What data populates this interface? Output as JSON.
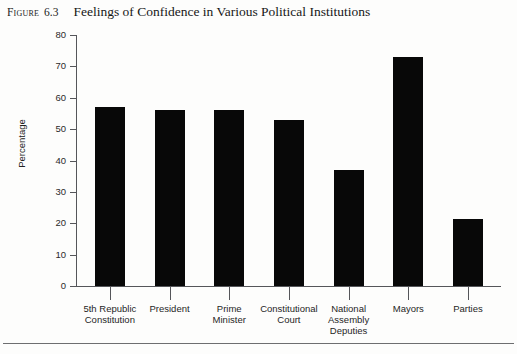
{
  "figure": {
    "label": "Figure",
    "number": "6.3",
    "title": "Feelings of Confidence in Various Political Institutions"
  },
  "chart_data": {
    "type": "bar",
    "title": "Feelings of Confidence in Various Political Institutions",
    "xlabel": "",
    "ylabel": "Percentage",
    "ylim": [
      0,
      80
    ],
    "yticks": [
      0,
      10,
      20,
      30,
      40,
      50,
      60,
      70,
      80
    ],
    "grid": false,
    "legend": false,
    "bar_color": "#080808",
    "axis_color": "#55565a",
    "categories": [
      "5th Republic Constitution",
      "President",
      "Prime Minister",
      "Constitutional Court",
      "National Assembly Deputies",
      "Mayors",
      "Parties"
    ],
    "category_lines": [
      [
        "5th Republic",
        "Constitution"
      ],
      [
        "President"
      ],
      [
        "Prime",
        "Minister"
      ],
      [
        "Constitutional",
        "Court"
      ],
      [
        "National",
        "Assembly",
        "Deputies"
      ],
      [
        "Mayors"
      ],
      [
        "Parties"
      ]
    ],
    "values": [
      57,
      56,
      56,
      53,
      37,
      73,
      21.5
    ]
  }
}
